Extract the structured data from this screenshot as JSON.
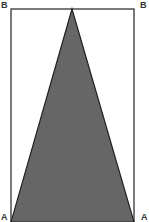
{
  "diagram": {
    "labels": {
      "top_left": "B",
      "top_right": "B",
      "bottom_left": "A",
      "bottom_right": "A"
    },
    "colors": {
      "triangle_fill": "#666666",
      "stroke": "#222222",
      "background": "#ffffff"
    },
    "shapes": {
      "rectangle": {
        "x": 11,
        "y": 9,
        "width": 123,
        "height": 213
      },
      "triangle": {
        "apex": [
          72,
          9
        ],
        "base_left": [
          11,
          222
        ],
        "base_right": [
          134,
          222
        ]
      }
    }
  }
}
